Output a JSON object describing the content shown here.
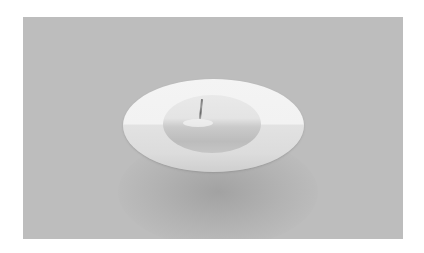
{
  "image": {
    "description": "Grayscale photograph of a white elliptical disc with a cracked dome-shaped lump in its center, casting a soft shadow on a gray background",
    "colors": {
      "page_background": "#ffffff",
      "photo_background": "#bdbdbd",
      "disc": "#f0f0f0",
      "dome": "#d0d0d0",
      "crack": "#707070"
    }
  }
}
